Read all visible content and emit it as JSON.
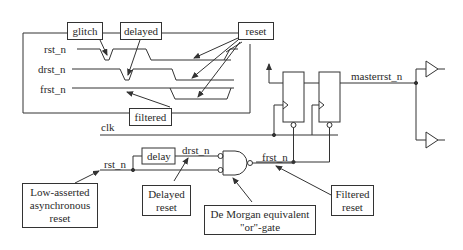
{
  "timing": {
    "callouts": {
      "glitch": "glitch",
      "delayed": "delayed",
      "reset": "reset",
      "filtered": "filtered"
    },
    "signals": [
      "rst_n",
      "drst_n",
      "frst_n"
    ]
  },
  "circuit": {
    "signals": {
      "clk": "clk",
      "rst_n": "rst_n",
      "drst_n": "drst_n",
      "frst_n": "frst_n",
      "masterrst_n": "masterrst_n"
    },
    "delay_block": "delay",
    "annotations": {
      "low_asserted": [
        "Low-asserted",
        "asynchronous",
        "reset"
      ],
      "delayed_reset": [
        "Delayed",
        "reset"
      ],
      "de_morgan": [
        "De Morgan equivalent",
        "\"or\"-gate"
      ],
      "filtered_reset": [
        "Filtered",
        "reset"
      ]
    }
  },
  "colors": {
    "line": "#333333",
    "background": "#ffffff"
  }
}
